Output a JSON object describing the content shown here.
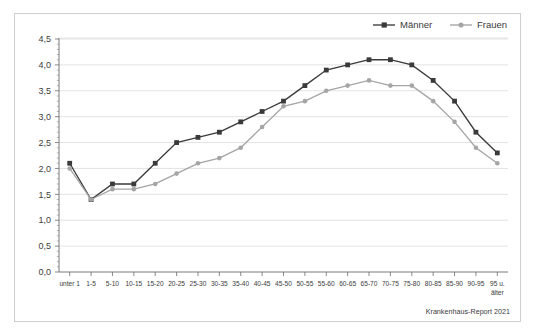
{
  "figure": {
    "source_note": "Krankenhaus-Report 2021"
  },
  "legend": {
    "position": "top-right",
    "entries": [
      {
        "label": "Männer",
        "color": "#3a3a3a",
        "marker": "square"
      },
      {
        "label": "Frauen",
        "color": "#a5a5a5",
        "marker": "diamond"
      }
    ]
  },
  "chart_data": {
    "type": "line",
    "title": "",
    "subtitle": "",
    "xlabel": "",
    "ylabel": "",
    "ylim": [
      0.0,
      4.5
    ],
    "ytick_step": 0.5,
    "grid": true,
    "ytick_labels": [
      "0,0",
      "0,5",
      "1,0",
      "1,5",
      "2,0",
      "2,5",
      "3,0",
      "3,5",
      "4,0",
      "4,5"
    ],
    "ytick_values": [
      0.0,
      0.5,
      1.0,
      1.5,
      2.0,
      2.5,
      3.0,
      3.5,
      4.0,
      4.5
    ],
    "categories": [
      "unter 1",
      "1-5",
      "5-10",
      "10-15",
      "15-20",
      "20-25",
      "25-30",
      "30-35",
      "35-40",
      "40-45",
      "45-50",
      "50-55",
      "55-60",
      "60-65",
      "65-70",
      "70-75",
      "75-80",
      "80-85",
      "85-90",
      "90-95",
      "95 u. älter"
    ],
    "series": [
      {
        "name": "Männer",
        "color": "#3a3a3a",
        "values": [
          2.1,
          1.4,
          1.7,
          1.7,
          2.1,
          2.5,
          2.6,
          2.7,
          2.9,
          3.1,
          3.3,
          3.6,
          3.9,
          4.0,
          4.1,
          4.1,
          4.0,
          3.7,
          3.3,
          2.7,
          2.3
        ]
      },
      {
        "name": "Frauen",
        "color": "#a5a5a5",
        "values": [
          2.0,
          1.4,
          1.6,
          1.6,
          1.7,
          1.9,
          2.1,
          2.2,
          2.4,
          2.8,
          3.2,
          3.3,
          3.5,
          3.6,
          3.7,
          3.6,
          3.6,
          3.3,
          2.9,
          2.4,
          2.1
        ]
      }
    ]
  }
}
